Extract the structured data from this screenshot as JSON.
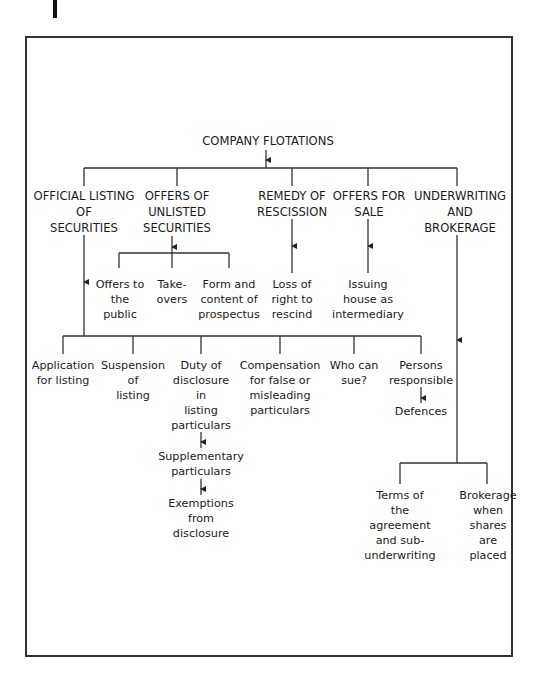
{
  "root": {
    "label": "COMPANY FLOTATIONS"
  },
  "level1": [
    {
      "id": "official",
      "label": "OFFICIAL LISTING\nOF\nSECURITIES"
    },
    {
      "id": "unlisted",
      "label": "OFFERS OF\nUNLISTED\nSECURITIES"
    },
    {
      "id": "remedy",
      "label": "REMEDY OF\nRESCISSION"
    },
    {
      "id": "sale",
      "label": "OFFERS FOR\nSALE"
    },
    {
      "id": "underwriting",
      "label": "UNDERWRITING\nAND\nBROKERAGE"
    }
  ],
  "unlisted_children": [
    {
      "label": "Offers to\nthe\npublic"
    },
    {
      "label": "Take-\novers"
    },
    {
      "label": "Form and\ncontent of\nprospectus"
    }
  ],
  "remedy_child": {
    "label": "Loss of\nright to\nrescind"
  },
  "sale_child": {
    "label": "Issuing\nhouse as\nintermediary"
  },
  "official_children": [
    {
      "label": "Application\nfor listing"
    },
    {
      "label": "Suspension\nof\nlisting"
    },
    {
      "label": "Duty of\ndisclosure\nin\nlisting\nparticulars"
    },
    {
      "label": "Compensation\nfor false or\nmisleading\nparticulars"
    },
    {
      "label": "Who can\nsue?"
    },
    {
      "label": "Persons\nresponsible"
    }
  ],
  "duty_chain": [
    {
      "label": "Supplementary\nparticulars"
    },
    {
      "label": "Exemptions\nfrom\ndisclosure"
    }
  ],
  "persons_child": {
    "label": "Defences"
  },
  "underwriting_children": [
    {
      "label": "Terms of\nthe\nagreement\nand sub-\nunderwriting"
    },
    {
      "label": "Brokerage\nwhen\nshares\nare\nplaced"
    }
  ],
  "colors": {
    "line": "#333333",
    "text": "#1a1a1a",
    "frame": "#333333"
  }
}
